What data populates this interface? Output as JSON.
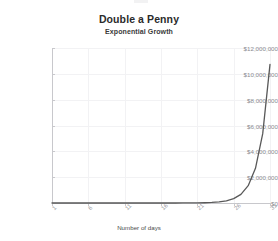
{
  "chart_data": {
    "type": "line",
    "title": "Double a Penny",
    "subtitle": "Exponential Growth",
    "xlabel": "Number of days",
    "ylabel": "",
    "xlim": [
      1,
      31
    ],
    "ylim": [
      0,
      12000000
    ],
    "grid": true,
    "legend": null,
    "line_color": "#595959",
    "ytick_labels": [
      "$12,000,000",
      "$10,000,000",
      "$8,000,000",
      "$6,000,000",
      "$4,000,000",
      "$2,000,000",
      "$0"
    ],
    "ytick_values": [
      12000000,
      10000000,
      8000000,
      6000000,
      4000000,
      2000000,
      0
    ],
    "xtick_labels": [
      "1",
      "6",
      "11",
      "16",
      "21",
      "26",
      "31"
    ],
    "xtick_values": [
      1,
      6,
      11,
      16,
      21,
      26,
      31
    ],
    "x": [
      1,
      2,
      3,
      4,
      5,
      6,
      7,
      8,
      9,
      10,
      11,
      12,
      13,
      14,
      15,
      16,
      17,
      18,
      19,
      20,
      21,
      22,
      23,
      24,
      25,
      26,
      27,
      28,
      29,
      30,
      31
    ],
    "values": [
      0.01,
      0.02,
      0.04,
      0.08,
      0.16,
      0.32,
      0.64,
      1.28,
      2.56,
      5.12,
      10.24,
      20.48,
      40.96,
      81.92,
      163.84,
      327.68,
      655.36,
      1310.72,
      2621.44,
      5242.88,
      10485.76,
      20971.52,
      41943.04,
      83886.08,
      167772.16,
      335544.32,
      671088.64,
      1342177.28,
      2684354.56,
      5368709.12,
      10737418.24
    ],
    "series": [
      {
        "name": "Amount",
        "values": [
          0.01,
          0.02,
          0.04,
          0.08,
          0.16,
          0.32,
          0.64,
          1.28,
          2.56,
          5.12,
          10.24,
          20.48,
          40.96,
          81.92,
          163.84,
          327.68,
          655.36,
          1310.72,
          2621.44,
          5242.88,
          10485.76,
          20971.52,
          41943.04,
          83886.08,
          167772.16,
          335544.32,
          671088.64,
          1342177.28,
          2684354.56,
          5368709.12,
          10737418.24
        ]
      }
    ]
  },
  "colors": {
    "line": "#595959",
    "grid": "#f2f2f4",
    "axis": "#c8c8cc",
    "title_text": "#2b2b2b",
    "tick_text": "#8a8a90",
    "background": "#ffffff"
  }
}
